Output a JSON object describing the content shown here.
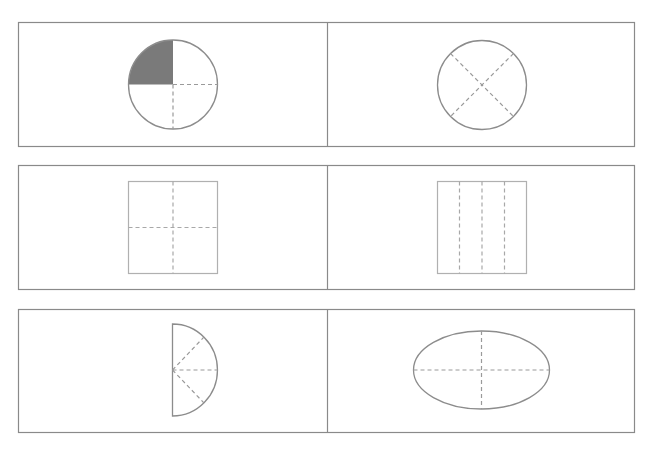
{
  "diagram": {
    "colors": {
      "frame": "#8a8a8a",
      "outline": "#8c8c8c",
      "square_outline": "#b0b0b0",
      "dashed": "#9a9a9a",
      "shaded": "#7a7a7a",
      "background": "#ffffff"
    },
    "panels": [
      {
        "id": "circle-quarter-shaded",
        "shape": "circle",
        "divisions": 4,
        "shaded_parts": 1,
        "division_style": "horizontal and vertical radii (shaded top-left quarter)"
      },
      {
        "id": "circle-x-divided",
        "shape": "circle",
        "divisions": 4,
        "shaded_parts": 0,
        "division_style": "two diagonal diameters"
      },
      {
        "id": "square-four-quarters",
        "shape": "square",
        "divisions": 4,
        "shaded_parts": 0,
        "division_style": "one horizontal and one vertical midline"
      },
      {
        "id": "square-four-strips",
        "shape": "square",
        "divisions": 4,
        "shaded_parts": 0,
        "division_style": "three vertical lines"
      },
      {
        "id": "semicircle-four-sectors",
        "shape": "semicircle",
        "divisions": 4,
        "shaded_parts": 0,
        "division_style": "three radii from center of straight edge"
      },
      {
        "id": "ellipse-four-parts",
        "shape": "ellipse",
        "divisions": 4,
        "shaded_parts": 0,
        "division_style": "major and minor axes"
      }
    ]
  }
}
